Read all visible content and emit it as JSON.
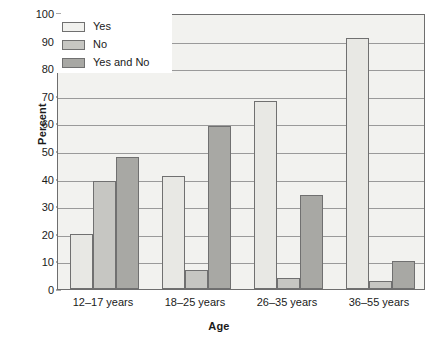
{
  "chart_data": {
    "type": "bar",
    "title": "",
    "xlabel": "Age",
    "ylabel": "Percent",
    "categories": [
      "12–17 years",
      "18–25 years",
      "26–35 years",
      "36–55 years"
    ],
    "series": [
      {
        "name": "Yes",
        "values": [
          20,
          41,
          68,
          91
        ],
        "color": "#e8e8e4"
      },
      {
        "name": "No",
        "values": [
          39,
          7,
          4,
          3
        ],
        "color": "#c6c6c2"
      },
      {
        "name": "Yes and No",
        "values": [
          48,
          59,
          34,
          10
        ],
        "color": "#a8a8a4"
      }
    ],
    "ylim": [
      0,
      100
    ],
    "yticks": [
      0,
      10,
      20,
      30,
      40,
      50,
      60,
      70,
      80,
      90,
      100
    ],
    "grid": true,
    "legend_position": "top-left",
    "plot_background": "#f2f2ef"
  },
  "axes": {
    "y_title": "Percent",
    "x_title": "Age",
    "y_tick_labels": [
      "0",
      "10",
      "20",
      "30",
      "40",
      "50",
      "60",
      "70",
      "80",
      "90",
      "100"
    ],
    "x_tick_labels": [
      "12–17 years",
      "18–25 years",
      "26–35 years",
      "36–55 years"
    ]
  },
  "legend": {
    "items": [
      {
        "label": "Yes"
      },
      {
        "label": "No"
      },
      {
        "label": "Yes and No"
      }
    ]
  }
}
